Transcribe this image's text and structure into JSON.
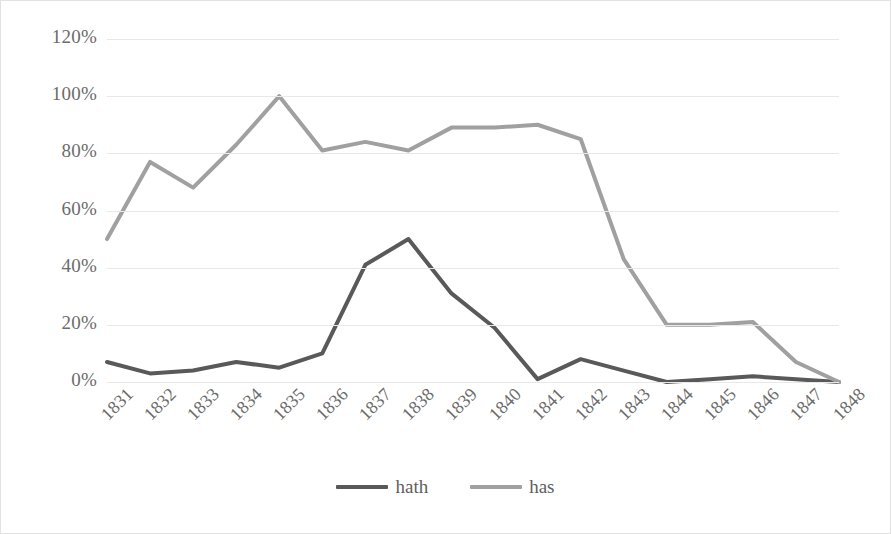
{
  "chart_data": {
    "type": "line",
    "title": "",
    "xlabel": "",
    "ylabel": "",
    "categories": [
      "1831",
      "1832",
      "1833",
      "1834",
      "1835",
      "1836",
      "1837",
      "1838",
      "1839",
      "1840",
      "1841",
      "1842",
      "1843",
      "1844",
      "1845",
      "1846",
      "1847",
      "1848"
    ],
    "ylim": [
      0,
      120
    ],
    "yticks": [
      "0%",
      "20%",
      "40%",
      "60%",
      "80%",
      "100%",
      "120%"
    ],
    "ytick_values": [
      0,
      20,
      40,
      60,
      80,
      100,
      120
    ],
    "grid": true,
    "legend_position": "bottom",
    "series": [
      {
        "name": "hath",
        "color": "#595959",
        "values": [
          7,
          3,
          4,
          7,
          5,
          10,
          41,
          50,
          31,
          19,
          1,
          8,
          4,
          0,
          1,
          2,
          1,
          0
        ]
      },
      {
        "name": "has",
        "color": "#a0a0a0",
        "values": [
          50,
          77,
          68,
          83,
          100,
          81,
          84,
          81,
          89,
          89,
          90,
          85,
          43,
          20,
          20,
          21,
          7,
          0
        ]
      }
    ]
  },
  "legend": {
    "items": [
      {
        "label": "hath",
        "swatch_name": "legend-swatch-hath"
      },
      {
        "label": "has",
        "swatch_name": "legend-swatch-has"
      }
    ]
  },
  "colors": {
    "series_hath": "#595959",
    "series_has": "#a0a0a0",
    "gridline": "#e8e8e8",
    "axis_text": "#6b6b6b",
    "frame_border": "#e2e2e2",
    "background": "#ffffff"
  }
}
